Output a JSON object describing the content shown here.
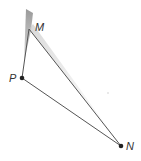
{
  "diagram": {
    "type": "triangle",
    "colors": {
      "line": "#555555",
      "point": "#222222",
      "label": "#333333",
      "shade_dark": "#9a9a9a",
      "shade_light": "#e6e6e6"
    },
    "points": [
      {
        "id": "M",
        "label": "M",
        "x": 29,
        "y": 29,
        "label_x": 35,
        "label_y": 31,
        "marked": false
      },
      {
        "id": "P",
        "label": "P",
        "x": 22,
        "y": 78,
        "label_x": 9,
        "label_y": 82,
        "marked": true
      },
      {
        "id": "N",
        "label": "N",
        "x": 121,
        "y": 146,
        "label_x": 126,
        "label_y": 150,
        "marked": true
      }
    ],
    "segments": [
      {
        "from": "P",
        "to": "M"
      },
      {
        "from": "M",
        "to": "N"
      },
      {
        "from": "P",
        "to": "N"
      }
    ],
    "shading": "shadow extending from above M along side MN"
  }
}
